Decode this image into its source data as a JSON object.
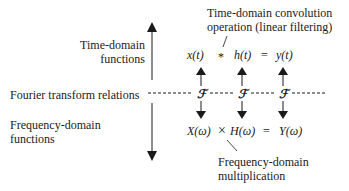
{
  "labels": {
    "time_domain": [
      "Time-domain",
      "functions"
    ],
    "fourier": "Fourier transform relations",
    "frequency_domain": [
      "Frequency-domain",
      "functions"
    ],
    "convolution_note": [
      "Time-domain convolution",
      "operation (linear filtering)"
    ],
    "multiplication_note": [
      "Frequency-domain",
      "multiplication"
    ]
  },
  "time_row": {
    "x": "x(t)",
    "conv_op": "*",
    "h": "h(t)",
    "eq": "=",
    "y": "y(t)"
  },
  "ft_symbol": "ℱ",
  "freq_row": {
    "X": "X(ω)",
    "mult_op": "×",
    "H": "H(ω)",
    "eq": "=",
    "Y": "Y(ω)"
  }
}
